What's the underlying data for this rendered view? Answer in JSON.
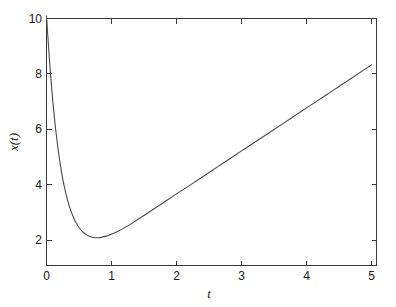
{
  "figure": {
    "background_color": "#ffffff",
    "axes_color": "#3a3a3a",
    "curve_color": "#4a4a4a"
  },
  "chart_data": {
    "type": "line",
    "title": "",
    "subtitle": "",
    "xlabel": "t",
    "ylabel": "x(t)",
    "xlim": [
      0,
      5
    ],
    "ylim": [
      1.1,
      10
    ],
    "grid": false,
    "legend": null,
    "xticks": [
      0,
      1,
      2,
      3,
      4,
      5
    ],
    "xticklabels": [
      "0",
      "1",
      "2",
      "3",
      "4",
      "5"
    ],
    "yticks": [
      2,
      4,
      6,
      8,
      10
    ],
    "yticklabels": [
      "2",
      "4",
      "6",
      "8",
      "10"
    ],
    "series": [
      {
        "name": "x(t)",
        "color": "#4a4a4a",
        "linewidth": 1.1,
        "x": [
          0,
          0.05,
          0.1,
          0.15,
          0.2,
          0.25,
          0.3,
          0.35,
          0.4,
          0.45,
          0.5,
          0.55,
          0.6,
          0.65,
          0.7,
          0.75,
          0.8,
          0.85,
          0.9,
          0.95,
          1,
          1.1,
          1.2,
          1.3,
          1.4,
          1.5,
          1.75,
          2,
          2.25,
          2.5,
          2.75,
          3,
          3.25,
          3.5,
          3.75,
          4,
          4.25,
          4.5,
          4.75,
          5
        ],
        "y": [
          10.1,
          8.36,
          6.95,
          5.82,
          4.93,
          4.22,
          3.67,
          3.24,
          2.92,
          2.66,
          2.47,
          2.33,
          2.23,
          2.16,
          2.12,
          2.1,
          2.1,
          2.12,
          2.15,
          2.18,
          2.23,
          2.33,
          2.46,
          2.6,
          2.75,
          2.9,
          3.29,
          3.68,
          4.06,
          4.45,
          4.84,
          5.23,
          5.61,
          6.0,
          6.39,
          6.78,
          7.16,
          7.55,
          7.94,
          8.33
        ]
      }
    ],
    "annotations": []
  }
}
